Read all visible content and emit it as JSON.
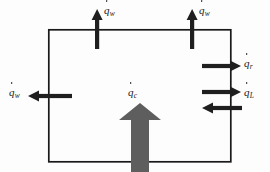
{
  "figure": {
    "background_color": "#fdfdfd",
    "stroke_color": "#1a1a1a",
    "arrow_fill": "#1f1f1f",
    "block_arrow_fill": "#5e5e5e",
    "box": {
      "x": 48,
      "y": 29,
      "width": 183,
      "height": 133,
      "stroke_width": 1.6
    },
    "symbol_base": "q",
    "labels": {
      "wall_top_left": {
        "base": "q",
        "subscript": "w",
        "dot": true,
        "x": 104,
        "y": 6
      },
      "wall_top_right": {
        "base": "q",
        "subscript": "w",
        "dot": true,
        "x": 199,
        "y": 6
      },
      "wall_left": {
        "base": "q",
        "subscript": "w",
        "dot": true,
        "x": 8,
        "y": 88
      },
      "radiation_right": {
        "base": "q",
        "subscript": "r",
        "dot": true,
        "x": 243,
        "y": 59
      },
      "latent_right": {
        "base": "q",
        "subscript": "L",
        "dot": true,
        "x": 243,
        "y": 88
      },
      "convection_center": {
        "base": "q",
        "subscript": "c",
        "dot": true,
        "x": 127,
        "y": 88
      }
    },
    "arrows": [
      {
        "name": "wall-flux-top-left",
        "direction": "up",
        "x": 97,
        "y_tail": 49,
        "y_tip": 10,
        "thickness": 4
      },
      {
        "name": "wall-flux-top-right",
        "direction": "up",
        "x": 192,
        "y_tail": 49,
        "y_tip": 10,
        "thickness": 4
      },
      {
        "name": "wall-flux-left",
        "direction": "left",
        "y": 96,
        "x_tail": 72,
        "x_tip": 28,
        "thickness": 4
      },
      {
        "name": "radiation-flux-right",
        "direction": "right",
        "y": 66,
        "x_tail": 202,
        "x_tip": 241,
        "thickness": 4
      },
      {
        "name": "latent-flux-right-out",
        "direction": "right",
        "y": 92,
        "x_tail": 202,
        "x_tip": 241,
        "thickness": 4
      },
      {
        "name": "latent-flux-right-in",
        "direction": "left",
        "y": 108,
        "x_tail": 241,
        "x_tip": 202,
        "thickness": 4
      },
      {
        "name": "convective-flux-bottom",
        "direction": "up",
        "x": 140,
        "y_tail": 172,
        "y_tip": 105,
        "thickness": 18
      }
    ]
  }
}
